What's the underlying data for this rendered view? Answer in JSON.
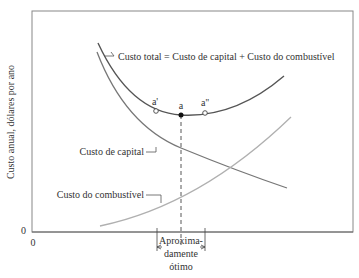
{
  "diagram": {
    "y_axis_label": "Custo anual, dólares por ano",
    "y_zero": "0",
    "x_zero": "0",
    "curves": {
      "total": {
        "label": "Custo total = Custo de capital + Custo do combustível",
        "color": "#555555"
      },
      "capital": {
        "label": "Custo de capital",
        "color": "#777777"
      },
      "fuel": {
        "label": "Custo do combustível",
        "color": "#b0b0b0"
      }
    },
    "points": {
      "a_prime": "a'",
      "a": "a",
      "a_double_prime": "a''"
    },
    "optimum_label": {
      "line1": "Aproxima-",
      "line2": "damente",
      "line3": "ótimo"
    }
  }
}
